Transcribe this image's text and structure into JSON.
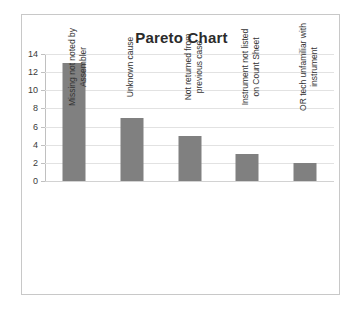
{
  "chart_data": {
    "type": "bar",
    "title": "Pareto Chart",
    "xlabel": "",
    "ylabel": "",
    "ylim": [
      0,
      14
    ],
    "ytick_step": 2,
    "yticks": [
      14,
      12,
      10,
      8,
      6,
      4,
      2,
      0
    ],
    "grid": true,
    "legend": false,
    "categories": [
      "Missing not noted by Assembler",
      "Unknown cause",
      "Not returned from previous case",
      "Instrument not listed on Count Sheet",
      "OR tech unfamiliar with instrument"
    ],
    "category_lines": [
      [
        "Missing not noted by",
        "Assembler"
      ],
      [
        "Unknown cause"
      ],
      [
        "Not returned from",
        "previous case"
      ],
      [
        "Instrument not listed",
        "on Count Sheet"
      ],
      [
        "OR tech unfamiliar with",
        "instrument"
      ]
    ],
    "values": [
      13,
      7,
      5,
      3,
      2
    ]
  },
  "style": {
    "bar_color": "#808080",
    "grid_color": "#e2e2e2",
    "axis_color": "#c0c0c0",
    "border_color": "#c8c8c8",
    "title_color": "#2b2b2b",
    "label_color": "#333333",
    "background": "#ffffff"
  }
}
